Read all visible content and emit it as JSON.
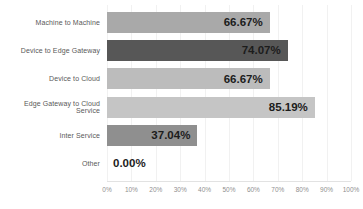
{
  "chart_data": {
    "type": "bar",
    "orientation": "horizontal",
    "title": "",
    "xlabel": "",
    "ylabel": "",
    "categories": [
      "Machine to Machine",
      "Device to Edge Gateway",
      "Device to Cloud",
      "Edge Gateway to Cloud Service",
      "Inter Service",
      "Other"
    ],
    "values": [
      66.67,
      74.07,
      66.67,
      85.19,
      37.04,
      0
    ],
    "value_labels": [
      "66.67%",
      "74.07%",
      "66.67%",
      "85.19%",
      "37.04%",
      "0.00%"
    ],
    "bar_colors": [
      "#a9a9a9",
      "#575757",
      "#bcbcbc",
      "#c5c5c5",
      "#8f8f8f",
      "transparent"
    ],
    "xlim": [
      0,
      100
    ],
    "x_ticks": [
      "0%",
      "10%",
      "20%",
      "30%",
      "40%",
      "50%",
      "60%",
      "70%",
      "80%",
      "90%",
      "100%"
    ],
    "grid": "faint vertical gridlines at 10% intervals",
    "legend": "none"
  },
  "colors": {
    "background": "#ffffff",
    "category_text": "#595959",
    "value_text": "#1c1c1c",
    "tick_text": "#8f8f8f",
    "gridline": "#f1f1f1",
    "axis_line": "#e2e2e2"
  }
}
